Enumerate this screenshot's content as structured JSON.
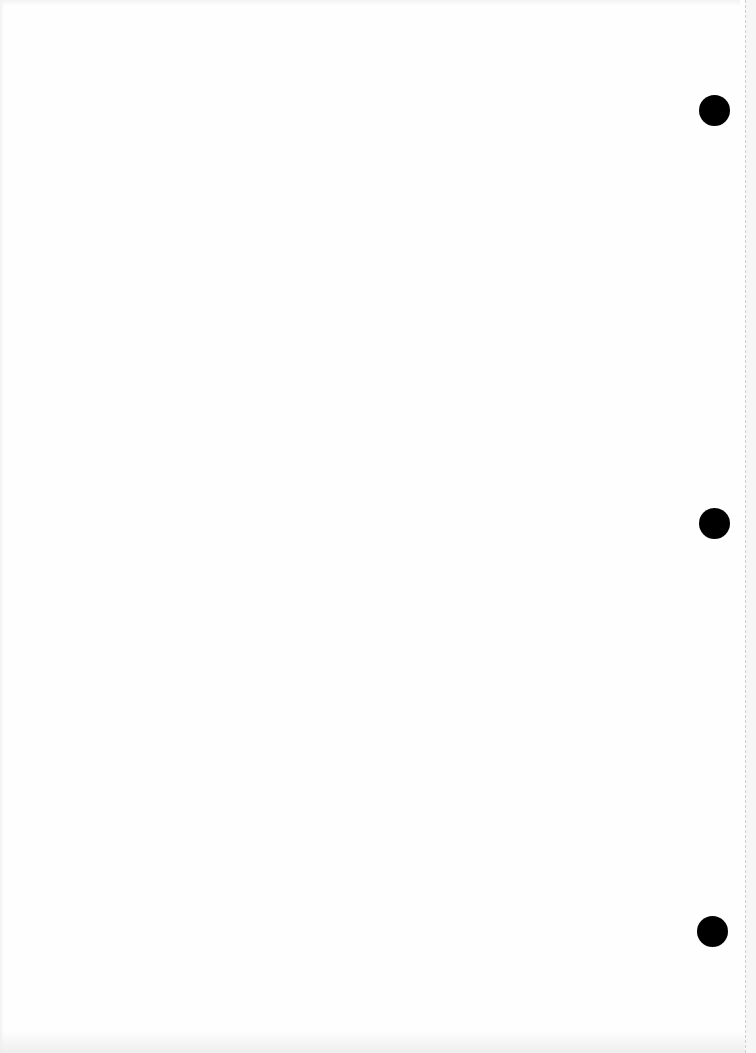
{
  "document": {
    "type": "scanned-blank-page",
    "text_content": "",
    "punch_holes": [
      {
        "position": "top",
        "color": "#000000"
      },
      {
        "position": "middle",
        "color": "#000000"
      },
      {
        "position": "bottom",
        "color": "#000000"
      }
    ],
    "colors": {
      "paper": "#fefefe",
      "hole": "#000000",
      "edge_line": "#cfcfcf"
    }
  }
}
